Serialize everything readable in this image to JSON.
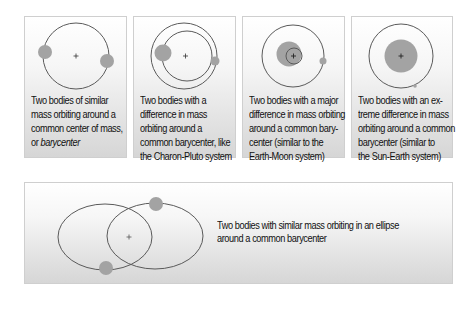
{
  "colors": {
    "orbit_line": "#5a5a5a",
    "body_fill": "#a3a3a3",
    "panel_border": "#cfcfcf",
    "text": "#111111"
  },
  "panels": [
    {
      "id": "similar-mass",
      "caption_lines": [
        "Two bodies of similar",
        "mass orbiting around a",
        "common center of mass,"
      ],
      "caption_last_prefix": "or ",
      "caption_last_italic": "barycenter"
    },
    {
      "id": "difference-in-mass",
      "caption_lines": [
        "Two bodies with a",
        "difference in mass",
        "orbiting around a",
        "common barycenter, like",
        "the Charon-Pluto system"
      ]
    },
    {
      "id": "major-difference",
      "caption_lines": [
        "Two bodies with a major",
        "difference in mass orbiting",
        "around a common bary-",
        "center (similar to the",
        "Earth-Moon system)"
      ]
    },
    {
      "id": "extreme-difference",
      "caption_lines": [
        "Two bodies with an ex-",
        "treme difference in mass",
        "orbiting around a common",
        "barycenter (similar to",
        "the Sun-Earth system)"
      ]
    }
  ],
  "bottom_panel": {
    "id": "elliptical-orbit",
    "caption_lines": [
      "Two bodies with similar mass orbiting in an ellipse",
      "around a common barycenter"
    ]
  },
  "icons": {
    "barycenter_marker": "plus-sign",
    "body": "filled-circle",
    "orbit": "circle-outline"
  }
}
